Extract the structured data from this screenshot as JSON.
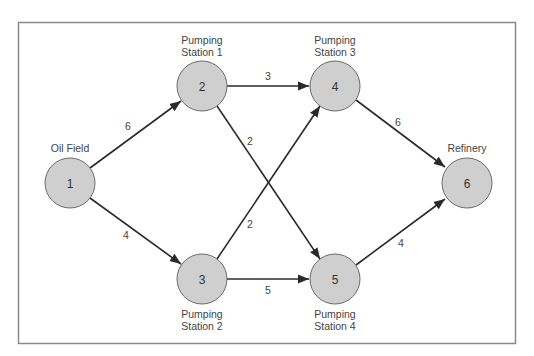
{
  "diagram": {
    "type": "directed-network",
    "nodes": [
      {
        "id": "1",
        "label_lines": [
          "Oil Field"
        ],
        "label_pos": "above",
        "x": 70,
        "y": 183
      },
      {
        "id": "2",
        "label_lines": [
          "Pumping",
          "Station 1"
        ],
        "label_pos": "above",
        "x": 202,
        "y": 86
      },
      {
        "id": "3",
        "label_lines": [
          "Pumping",
          "Station 2"
        ],
        "label_pos": "below",
        "x": 202,
        "y": 279
      },
      {
        "id": "4",
        "label_lines": [
          "Pumping",
          "Station 3"
        ],
        "label_pos": "above",
        "x": 335,
        "y": 86
      },
      {
        "id": "5",
        "label_lines": [
          "Pumping",
          "Station 4"
        ],
        "label_pos": "below",
        "x": 335,
        "y": 279
      },
      {
        "id": "6",
        "label_lines": [
          "Refinery"
        ],
        "label_pos": "above",
        "x": 467,
        "y": 183
      }
    ],
    "edges": [
      {
        "from": "1",
        "to": "2",
        "weight": "6",
        "lx": 128,
        "ly": 126
      },
      {
        "from": "1",
        "to": "3",
        "weight": "4",
        "lx": 126,
        "ly": 236
      },
      {
        "from": "2",
        "to": "4",
        "weight": "3",
        "lx": 268,
        "ly": 76
      },
      {
        "from": "2",
        "to": "5",
        "weight": "2",
        "lx": 250,
        "ly": 141
      },
      {
        "from": "3",
        "to": "4",
        "weight": "2",
        "lx": 250,
        "ly": 224
      },
      {
        "from": "3",
        "to": "5",
        "weight": "5",
        "lx": 268,
        "ly": 290
      },
      {
        "from": "4",
        "to": "6",
        "weight": "6",
        "lx": 398,
        "ly": 122
      },
      {
        "from": "5",
        "to": "6",
        "weight": "4",
        "lx": 401,
        "ly": 243
      }
    ],
    "colors": {
      "node_fill": "#cfcfcf",
      "node_stroke": "#6a6a6a",
      "edge": "#2a2a2a",
      "frame": "#8a8a8a",
      "text": "#444444"
    }
  },
  "labels": {
    "node1_id": "1",
    "node1_label": "Oil Field",
    "node2_id": "2",
    "node2_label_1": "Pumping",
    "node2_label_2": "Station 1",
    "node3_id": "3",
    "node3_label_1": "Pumping",
    "node3_label_2": "Station 2",
    "node4_id": "4",
    "node4_label_1": "Pumping",
    "node4_label_2": "Station 3",
    "node5_id": "5",
    "node5_label_1": "Pumping",
    "node5_label_2": "Station 4",
    "node6_id": "6",
    "node6_label": "Refinery",
    "e12": "6",
    "e13": "4",
    "e24": "3",
    "e25": "2",
    "e34": "2",
    "e35": "5",
    "e46": "6",
    "e56": "4"
  }
}
